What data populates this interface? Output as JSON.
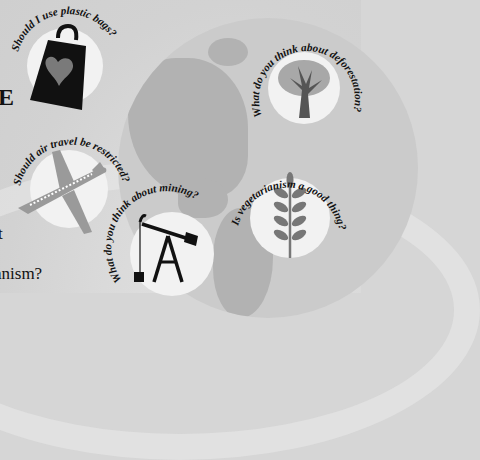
{
  "left_edge_text": {
    "heading_fragment": "E",
    "line1_fragment": "t",
    "line2_fragment": "anism?"
  },
  "topics": [
    {
      "id": "plastic-bags",
      "question": "Should I use plastic bags?",
      "icon": "shopping-bag-heart-icon"
    },
    {
      "id": "deforestation",
      "question": "What do you think about deforestation?",
      "icon": "tree-icon"
    },
    {
      "id": "air-travel",
      "question": "Should air travel be restricted?",
      "icon": "airplane-icon"
    },
    {
      "id": "mining",
      "question": "What do you think about mining?",
      "icon": "oil-pump-icon"
    },
    {
      "id": "vegetarianism",
      "question": "Is vegetarianism a good thing?",
      "icon": "wheat-icon"
    }
  ],
  "colors": {
    "background": "#d6d6d6",
    "globe": "#cbcbcb",
    "land": "#b2b2b2",
    "circle": "#f2f2f2",
    "icon_dark": "#111111",
    "icon_gray": "#808080"
  }
}
